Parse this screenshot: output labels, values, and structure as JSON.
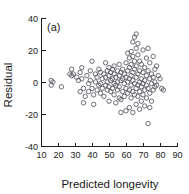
{
  "figure": {
    "panel_label": "(a)",
    "background_color": "#ffffff",
    "axis_color": "#1a1a1a",
    "point_color": "#5b5b66"
  },
  "chart_data": {
    "type": "scatter",
    "title": "(a)",
    "xlabel": "Predicted longevity",
    "ylabel": "Residual",
    "xlim": [
      10,
      90
    ],
    "ylim": [
      -40,
      40
    ],
    "xticks": [
      10,
      20,
      30,
      40,
      50,
      60,
      70,
      80,
      90
    ],
    "yticks": [
      -40,
      -20,
      0,
      20,
      40
    ],
    "xticklabels": [
      "10",
      "20",
      "30",
      "40",
      "50",
      "60",
      "70",
      "80",
      "90"
    ],
    "yticklabels": [
      "-40",
      "-20",
      "0",
      "20",
      "40"
    ],
    "grid": false,
    "legend": null,
    "marker": "open-circle",
    "points": [
      [
        16,
        1
      ],
      [
        16,
        -2
      ],
      [
        17,
        0
      ],
      [
        22,
        -3
      ],
      [
        27,
        5
      ],
      [
        28,
        4
      ],
      [
        28,
        8
      ],
      [
        29,
        5
      ],
      [
        31,
        3
      ],
      [
        32,
        1
      ],
      [
        33,
        6
      ],
      [
        33,
        -6
      ],
      [
        34,
        9
      ],
      [
        34,
        2
      ],
      [
        35,
        -4
      ],
      [
        35,
        -13
      ],
      [
        36,
        -9
      ],
      [
        37,
        4
      ],
      [
        38,
        -1
      ],
      [
        38,
        -6
      ],
      [
        39,
        7
      ],
      [
        39,
        1
      ],
      [
        40,
        13
      ],
      [
        40,
        -4
      ],
      [
        41,
        -8
      ],
      [
        41,
        -14
      ],
      [
        42,
        5
      ],
      [
        42,
        0
      ],
      [
        43,
        3
      ],
      [
        43,
        -5
      ],
      [
        44,
        8
      ],
      [
        44,
        -2
      ],
      [
        45,
        6
      ],
      [
        45,
        -1
      ],
      [
        45,
        -7
      ],
      [
        46,
        2
      ],
      [
        46,
        -4
      ],
      [
        47,
        5
      ],
      [
        47,
        -9
      ],
      [
        48,
        12
      ],
      [
        48,
        3
      ],
      [
        48,
        -2
      ],
      [
        49,
        7
      ],
      [
        49,
        0
      ],
      [
        49,
        -5
      ],
      [
        50,
        9
      ],
      [
        50,
        4
      ],
      [
        50,
        -3
      ],
      [
        50,
        -12
      ],
      [
        51,
        6
      ],
      [
        51,
        1
      ],
      [
        51,
        -6
      ],
      [
        52,
        8
      ],
      [
        52,
        2
      ],
      [
        52,
        -4
      ],
      [
        53,
        10
      ],
      [
        53,
        5
      ],
      [
        53,
        -1
      ],
      [
        53,
        -8
      ],
      [
        54,
        3
      ],
      [
        54,
        -2
      ],
      [
        54,
        -13
      ],
      [
        55,
        7
      ],
      [
        55,
        0
      ],
      [
        55,
        -5
      ],
      [
        56,
        11
      ],
      [
        56,
        4
      ],
      [
        56,
        -3
      ],
      [
        56,
        -10
      ],
      [
        57,
        6
      ],
      [
        57,
        1
      ],
      [
        57,
        -11
      ],
      [
        57,
        -19
      ],
      [
        58,
        8
      ],
      [
        58,
        2
      ],
      [
        58,
        -6
      ],
      [
        59,
        5
      ],
      [
        59,
        -1
      ],
      [
        59,
        -9
      ],
      [
        60,
        12
      ],
      [
        60,
        3
      ],
      [
        60,
        -4
      ],
      [
        60,
        -18
      ],
      [
        61,
        18
      ],
      [
        61,
        7
      ],
      [
        61,
        0
      ],
      [
        61,
        -7
      ],
      [
        62,
        15
      ],
      [
        62,
        9
      ],
      [
        62,
        2
      ],
      [
        62,
        -5
      ],
      [
        62,
        -16
      ],
      [
        63,
        19
      ],
      [
        63,
        11
      ],
      [
        63,
        4
      ],
      [
        63,
        -2
      ],
      [
        63,
        -10
      ],
      [
        64,
        25
      ],
      [
        64,
        16
      ],
      [
        64,
        6
      ],
      [
        64,
        1
      ],
      [
        64,
        -6
      ],
      [
        64,
        -19
      ],
      [
        65,
        28
      ],
      [
        65,
        13
      ],
      [
        65,
        8
      ],
      [
        65,
        -1
      ],
      [
        65,
        -8
      ],
      [
        66,
        30
      ],
      [
        66,
        21
      ],
      [
        66,
        10
      ],
      [
        66,
        3
      ],
      [
        66,
        -4
      ],
      [
        66,
        -14
      ],
      [
        67,
        24
      ],
      [
        67,
        17
      ],
      [
        67,
        5
      ],
      [
        67,
        -2
      ],
      [
        67,
        -9
      ],
      [
        68,
        13
      ],
      [
        68,
        7
      ],
      [
        68,
        0
      ],
      [
        68,
        -6
      ],
      [
        68,
        -17
      ],
      [
        69,
        11
      ],
      [
        69,
        2
      ],
      [
        69,
        -3
      ],
      [
        69,
        -12
      ],
      [
        70,
        20
      ],
      [
        70,
        6
      ],
      [
        70,
        -1
      ],
      [
        70,
        -8
      ],
      [
        71,
        9
      ],
      [
        71,
        1
      ],
      [
        71,
        -5
      ],
      [
        71,
        -15
      ],
      [
        72,
        15
      ],
      [
        72,
        4
      ],
      [
        72,
        -2
      ],
      [
        72,
        -10
      ],
      [
        73,
        21
      ],
      [
        73,
        7
      ],
      [
        73,
        -4
      ],
      [
        73,
        -26
      ],
      [
        74,
        12
      ],
      [
        74,
        2
      ],
      [
        74,
        -7
      ],
      [
        74,
        -16
      ],
      [
        75,
        5
      ],
      [
        75,
        -1
      ],
      [
        75,
        -12
      ],
      [
        76,
        16
      ],
      [
        76,
        3
      ],
      [
        76,
        -5
      ],
      [
        77,
        8
      ],
      [
        77,
        0
      ],
      [
        77,
        -3
      ],
      [
        78,
        10
      ],
      [
        78,
        -2
      ],
      [
        79,
        4
      ],
      [
        80,
        2
      ],
      [
        81,
        -4
      ],
      [
        82,
        -5
      ]
    ]
  }
}
